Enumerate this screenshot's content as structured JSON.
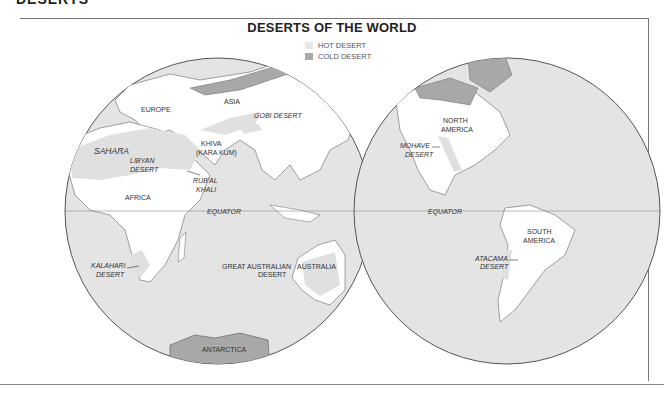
{
  "page_heading": "DESERTS",
  "map": {
    "title": "DESERTS OF THE WORLD",
    "legend": [
      {
        "label": "HOT DESERT",
        "color": "#e8e8e8"
      },
      {
        "label": "COLD DESERT",
        "color": "#a9a9a9"
      }
    ],
    "colors": {
      "ocean": "#e4e4e4",
      "land": "#ffffff",
      "hot_desert": "#e0e0e0",
      "cold_desert": "#a8a8a8",
      "outline": "#555555"
    },
    "labels": {
      "europe": "EUROPE",
      "asia": "ASIA",
      "gobi": "GOBI DESERT",
      "sahara": "SAHARA",
      "libyan_1": "LIBYAN",
      "libyan_2": "DESERT",
      "khiva_1": "KHIVA",
      "khiva_2": "(KARA KUM)",
      "rubal_1": "RUB'AL",
      "rubal_2": "KHALI",
      "africa": "AFRICA",
      "equator_left": "EQUATOR",
      "equator_right": "EQUATOR",
      "kalahari_1": "KALAHARI",
      "kalahari_2": "DESERT",
      "great_aus_1": "GREAT AUSTRALIAN",
      "great_aus_2": "DESERT",
      "australia": "AUSTRALIA",
      "antarctica": "ANTARCTICA",
      "north_america_1": "NORTH",
      "north_america_2": "AMERICA",
      "mohave_1": "MOHAVE",
      "mohave_2": "DESERT",
      "south_america_1": "SOUTH",
      "south_america_2": "AMERICA",
      "atacama_1": "ATACAMA",
      "atacama_2": "DESERT"
    }
  }
}
